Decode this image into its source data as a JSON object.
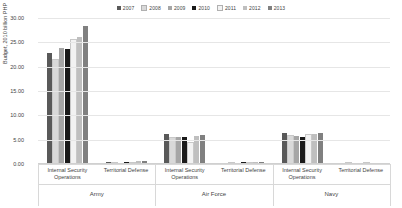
{
  "chart_data": {
    "type": "bar",
    "title": "",
    "xlabel": "",
    "ylabel": "Budget, 2010 billion PHP",
    "ylim": [
      0,
      30
    ],
    "ytick_values": [
      0,
      5,
      10,
      15,
      20,
      25,
      30
    ],
    "ytick_labels": [
      "0.00",
      "5.00",
      "10.00",
      "15.00",
      "20.00",
      "25.00",
      "30.00"
    ],
    "grid": true,
    "legend_position": "top-center",
    "categories": [
      "Internal Security Operations",
      "Territorial Defense",
      "Internal Security Operations",
      "Territorial Defense",
      "Internal Security Operations",
      "Territorial Defense"
    ],
    "group_labels": [
      "Army",
      "Air Force",
      "Navy"
    ],
    "series": [
      {
        "name": "2007",
        "color": "#595959",
        "values": [
          22.9,
          0.35,
          6.1,
          0.2,
          6.4,
          0.05
        ]
      },
      {
        "name": "2008",
        "color": "#d9d9d9",
        "values": [
          21.3,
          0.1,
          5.3,
          0.2,
          5.8,
          0.05
        ]
      },
      {
        "name": "2009",
        "color": "#a6a6a6",
        "values": [
          23.9,
          0.1,
          5.5,
          0.2,
          5.8,
          0.1
        ]
      },
      {
        "name": "2010",
        "color": "#1a1a1a",
        "values": [
          23.6,
          0.4,
          5.5,
          0.45,
          5.6,
          0.15
        ]
      },
      {
        "name": "2011",
        "color": "#f2f2f2",
        "values": [
          25.5,
          0.1,
          4.4,
          0.15,
          6.0,
          0.05
        ]
      },
      {
        "name": "2012",
        "color": "#bfbfbf",
        "values": [
          26.1,
          0.55,
          5.8,
          0.35,
          6.2,
          0.1
        ]
      },
      {
        "name": "2013",
        "color": "#808080",
        "values": [
          28.4,
          0.6,
          5.9,
          0.35,
          6.3,
          0.1
        ]
      }
    ]
  }
}
